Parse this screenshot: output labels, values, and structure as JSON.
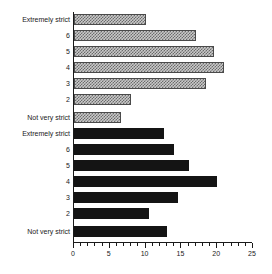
{
  "chart_data": {
    "type": "bar",
    "orientation": "horizontal",
    "title": "",
    "xlabel": "",
    "ylabel": "",
    "xlim": [
      0,
      25
    ],
    "grid": false,
    "legend_position": "none",
    "xticks": [
      0,
      5,
      10,
      15,
      20,
      25
    ],
    "xtick_labels": [
      "0",
      "5",
      "10",
      "15",
      "20",
      "25"
    ],
    "minor_tick_step": 1,
    "categories": [
      "Extremely strict",
      "6",
      "5",
      "4",
      "3",
      "2",
      "Not very strict"
    ],
    "series": [
      {
        "name": "hatched-group",
        "style": "hatched",
        "color": "#c9c9c9",
        "values": [
          10,
          17,
          19.5,
          21,
          18.5,
          8,
          6.5
        ]
      },
      {
        "name": "solid-group",
        "style": "solid",
        "color": "#141414",
        "values": [
          12.5,
          14,
          16,
          20,
          14.5,
          10.5,
          13
        ]
      }
    ]
  },
  "axis": {
    "tick_labels": [
      "0",
      "5",
      "10",
      "15",
      "20",
      "25"
    ]
  },
  "group_top": {
    "labels": [
      "Extremely strict",
      "6",
      "5",
      "4",
      "3",
      "2",
      "Not very strict"
    ]
  },
  "group_bottom": {
    "labels": [
      "Extremely strict",
      "6",
      "5",
      "4",
      "3",
      "2",
      "Not very strict"
    ]
  }
}
